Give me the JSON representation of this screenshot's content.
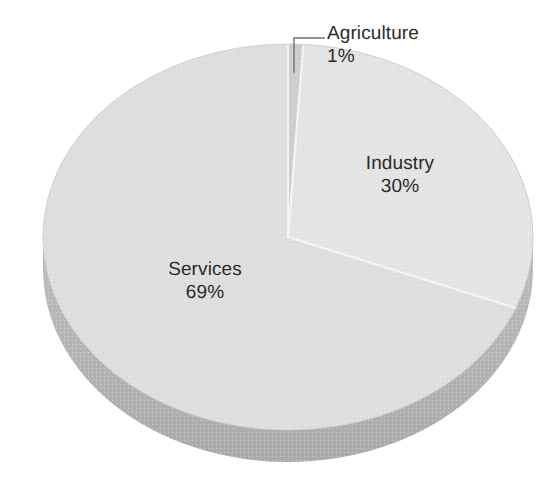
{
  "chart_data": {
    "type": "pie",
    "title": "",
    "subtitle": "",
    "xlabel": "",
    "ylabel": "",
    "legend_position": "none",
    "grid": false,
    "value_unit": "%",
    "categories": [
      "Agriculture",
      "Industry",
      "Services"
    ],
    "values": [
      1,
      30,
      69
    ],
    "labels": [
      {
        "name": "Agriculture",
        "value": "1%",
        "numeric": 1
      },
      {
        "name": "Industry",
        "value": "30%",
        "numeric": 30
      },
      {
        "name": "Services",
        "value": "69%",
        "numeric": 69
      }
    ],
    "annotations": [
      {
        "name": "agriculture-leader-line",
        "text": ""
      }
    ],
    "style": {
      "background": "#ffffff",
      "slice_agriculture_color": "#cdcdcd",
      "slice_industry_color": "#e3e3e3",
      "slice_services_color": "#dedede",
      "rim_color": "#b5b5b5",
      "rim_shadow_color": "#a9a9a9",
      "edge_line_color": "#ffffff",
      "outline_color": "#c9c9c9",
      "label_text_color": "#2b2b2b",
      "leader_line_color": "#6f6f6f"
    },
    "geometry": {
      "center_x": 288,
      "center_y": 237,
      "radius_x": 245,
      "radius_y": 193,
      "depth": 32,
      "start_angle_deg": 0,
      "direction": "clockwise"
    }
  },
  "labels": {
    "agriculture": {
      "name": "Agriculture",
      "value": "1%"
    },
    "industry": {
      "name": "Industry",
      "value": "30%"
    },
    "services": {
      "name": "Services",
      "value": "69%"
    }
  }
}
